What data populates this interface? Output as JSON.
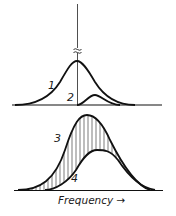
{
  "diagram": {
    "top_panel": {
      "curves": [
        {
          "id": "curve-1",
          "label": "1"
        },
        {
          "id": "curve-2",
          "label": "2"
        }
      ],
      "break_mark": "≈"
    },
    "bottom_panel": {
      "curves": [
        {
          "id": "curve-3",
          "label": "3"
        },
        {
          "id": "curve-4",
          "label": "4"
        }
      ],
      "hatched_region": "between curve 3 and curve 4"
    },
    "x_axis_label": "Frequency →",
    "colors": {
      "line": "#111111",
      "background": "#ffffff"
    }
  }
}
